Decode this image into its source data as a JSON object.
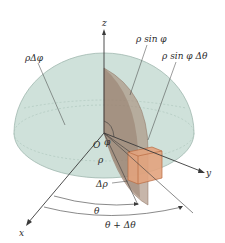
{
  "diagram": {
    "colors": {
      "hemisphere_fill": "#cfe1da",
      "hemisphere_edge": "#9fb8ae",
      "wedge": "#a98f7c",
      "box": "#e2a37d",
      "box_edge": "#b96a41",
      "line": "#3a3a3a"
    },
    "axes": {
      "x": "x",
      "y": "y",
      "z": "z"
    },
    "labels": {
      "rho_delta_phi": "ρΔφ",
      "rho_sin_phi": "ρ sin φ",
      "rho_sin_phi_delta_theta": "ρ sin φ Δθ",
      "origin": "O",
      "phi": "φ",
      "rho": "ρ",
      "delta_rho": "Δρ",
      "theta": "θ",
      "theta_plus_delta_theta": "θ + Δθ"
    }
  }
}
